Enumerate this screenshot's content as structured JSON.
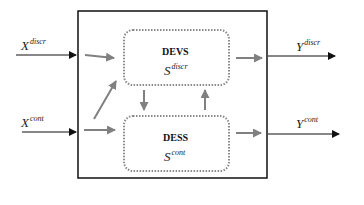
{
  "diagram": {
    "inputs": [
      {
        "base": "X",
        "sup": "discr"
      },
      {
        "base": "X",
        "sup": "cont"
      }
    ],
    "outputs": [
      {
        "base": "Y",
        "sup": "discr"
      },
      {
        "base": "Y",
        "sup": "cont"
      }
    ],
    "blocks": [
      {
        "title": "DEVS",
        "symbol": {
          "base": "S",
          "sup": "discr"
        }
      },
      {
        "title": "DESS",
        "symbol": {
          "base": "S",
          "sup": "cont"
        }
      }
    ],
    "colors": {
      "outer_border": "#111111",
      "inner_border": "#888888",
      "inner_arrow": "#808080",
      "io_arrow": "#111111"
    }
  }
}
